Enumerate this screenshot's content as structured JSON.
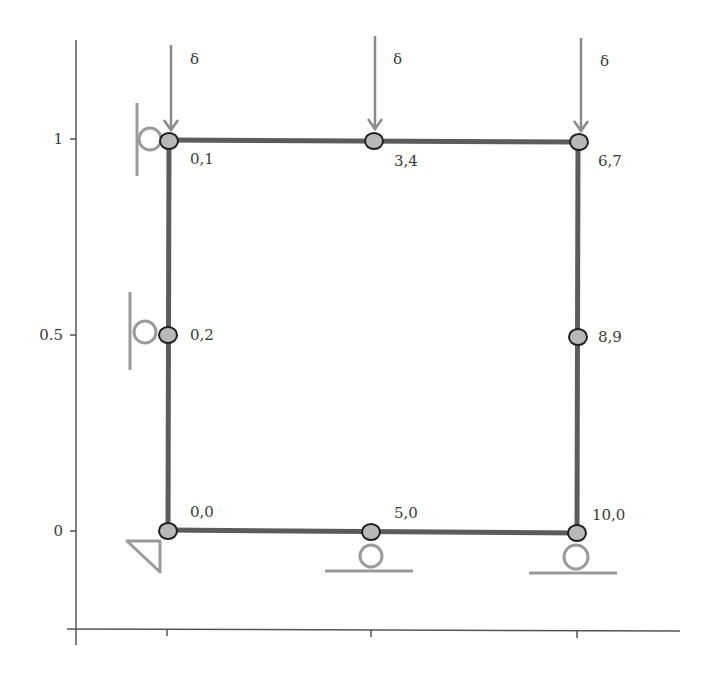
{
  "diagram": {
    "type": "structural-frame",
    "colors": {
      "member": "#5c5c5c",
      "node_fill": "#b8b8b8",
      "node_stroke": "#1e1e1e",
      "support": "#9a9a9a",
      "load_arrow": "#8a8a8a",
      "axis": "#555555",
      "text": "#3a3a3a"
    },
    "axes": {
      "y_ticks": [
        {
          "value": 0,
          "label": "0"
        },
        {
          "value": 0.5,
          "label": "0.5"
        },
        {
          "value": 1,
          "label": "1"
        }
      ],
      "x_ticks": [
        {
          "value": 0,
          "label": ""
        },
        {
          "value": 0.5,
          "label": ""
        },
        {
          "value": 1,
          "label": ""
        }
      ]
    },
    "nodes": [
      {
        "id": "n00",
        "x": 0,
        "y": 0,
        "label": "0,0"
      },
      {
        "id": "n50",
        "x": 0.5,
        "y": 0,
        "label": "5,0"
      },
      {
        "id": "n100",
        "x": 1,
        "y": 0,
        "label": "10,0"
      },
      {
        "id": "n02",
        "x": 0,
        "y": 0.5,
        "label": "0,2"
      },
      {
        "id": "n89",
        "x": 1,
        "y": 0.5,
        "label": "8,9"
      },
      {
        "id": "n01",
        "x": 0,
        "y": 1,
        "label": "0,1"
      },
      {
        "id": "n34",
        "x": 0.5,
        "y": 1,
        "label": "3,4"
      },
      {
        "id": "n67",
        "x": 1,
        "y": 1,
        "label": "6,7"
      }
    ],
    "members": [
      {
        "from": "n00",
        "to": "n50"
      },
      {
        "from": "n50",
        "to": "n100"
      },
      {
        "from": "n100",
        "to": "n89"
      },
      {
        "from": "n89",
        "to": "n67"
      },
      {
        "from": "n67",
        "to": "n34"
      },
      {
        "from": "n34",
        "to": "n01"
      },
      {
        "from": "n01",
        "to": "n02"
      },
      {
        "from": "n02",
        "to": "n00"
      }
    ],
    "supports": [
      {
        "node": "n00",
        "type": "pin"
      },
      {
        "node": "n50",
        "type": "roller-vertical"
      },
      {
        "node": "n100",
        "type": "roller-vertical"
      },
      {
        "node": "n02",
        "type": "roller-horizontal"
      },
      {
        "node": "n01",
        "type": "roller-horizontal"
      }
    ],
    "loads": [
      {
        "node": "n01",
        "direction": "down",
        "label": "δ"
      },
      {
        "node": "n34",
        "direction": "down",
        "label": "δ"
      },
      {
        "node": "n67",
        "direction": "down",
        "label": "δ"
      }
    ]
  }
}
